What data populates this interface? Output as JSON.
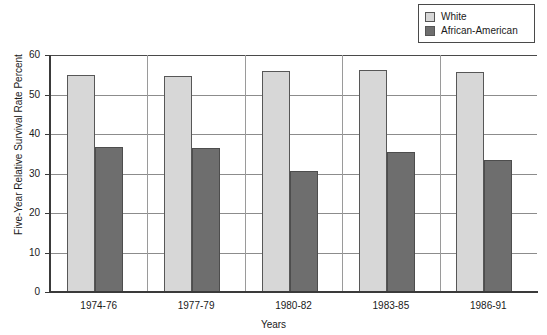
{
  "chart_data": {
    "type": "bar",
    "title": "",
    "subtitle": "",
    "xlabel": "Years",
    "ylabel": "Five-Year Relative Survival Rate Percent",
    "categories": [
      "1974-76",
      "1977-79",
      "1980-82",
      "1983-85",
      "1986-91"
    ],
    "series": [
      {
        "name": "White",
        "color": "#d7d7d7",
        "values": [
          55.0,
          54.8,
          56.0,
          56.2,
          55.6
        ]
      },
      {
        "name": "African-American",
        "color": "#6e6e6e",
        "values": [
          36.6,
          36.5,
          30.6,
          35.5,
          33.5
        ]
      }
    ],
    "ylim": [
      0,
      60
    ],
    "yticks": [
      0,
      10,
      20,
      30,
      40,
      50,
      60
    ],
    "ytick_labels": [
      "0",
      "10",
      "20",
      "30",
      "40",
      "50",
      "60"
    ],
    "grid": true,
    "grid_axis": "y",
    "legend_position": "top-right",
    "orientation": "vertical",
    "bar_group_mode": "grouped"
  },
  "legend": {
    "items": [
      {
        "label": "White",
        "color": "#d7d7d7"
      },
      {
        "label": "African-American",
        "color": "#6e6e6e"
      }
    ]
  },
  "axes": {
    "y_title": "Five-Year Relative Survival Rate Percent",
    "x_title": "Years",
    "y_ticks": [
      "60",
      "50",
      "40",
      "30",
      "20",
      "10",
      "0"
    ],
    "x_ticks": [
      "1974-76",
      "1977-79",
      "1980-82",
      "1983-85",
      "1986-91"
    ]
  }
}
